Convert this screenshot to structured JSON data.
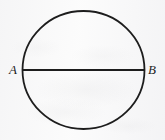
{
  "figure": {
    "type": "geometry-diagram",
    "background_color": "#f8f8f8",
    "stroke_color": "#1d1d1d",
    "canvas": {
      "width": 165,
      "height": 140
    }
  },
  "shapes": {
    "circle": {
      "name": "circle",
      "center_x": 83.5,
      "center_y": 70,
      "radius_x": 61,
      "radius_y": 59,
      "stroke_width": 1.8,
      "fill": "none"
    },
    "diameter": {
      "name": "diameter-AB",
      "x1": 22.5,
      "y1": 70,
      "x2": 144.5,
      "y2": 70,
      "stroke_width": 1.8
    }
  },
  "labels": {
    "a": "A",
    "b": "B"
  }
}
